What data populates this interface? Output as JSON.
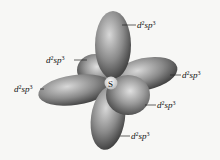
{
  "diagram": {
    "central_atom": "S",
    "orbital_label": {
      "base1": "d",
      "sup1": "2",
      "base2": "sp",
      "sup2": "3"
    },
    "labels": [
      {
        "name": "top",
        "text": "d2sp3"
      },
      {
        "name": "upper-left",
        "text": "d2sp3"
      },
      {
        "name": "left",
        "text": "d2sp3"
      },
      {
        "name": "right",
        "text": "d2sp3"
      },
      {
        "name": "lower-right",
        "text": "d2sp3"
      },
      {
        "name": "bottom",
        "text": "d2sp3"
      }
    ],
    "colors": {
      "lobe_dark": "#3a3a3a",
      "lobe_mid": "#8a8a8a",
      "lobe_light": "#d8d8d8",
      "background": "#f7f7f5"
    }
  }
}
